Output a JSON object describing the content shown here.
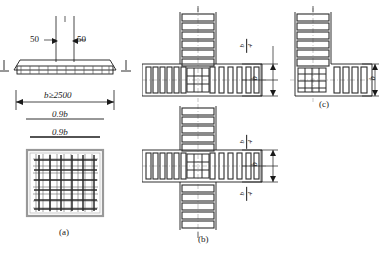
{
  "figure": {
    "title": "",
    "panels": [
      {
        "id": "a",
        "label": "(a)",
        "caption": "foundation slab reinforcement"
      },
      {
        "id": "b",
        "label": "(b)",
        "caption": "interior cruciform joint stirrups"
      },
      {
        "id": "c",
        "label": "(c)",
        "caption": "corner joint stirrups"
      }
    ]
  },
  "panel_a": {
    "label": "(a)",
    "cover_left": "50",
    "cover_right": "50",
    "level_mark_left": "⊥",
    "level_mark_right": "⊥",
    "dim_width": "b≥2500",
    "dim_mid": "0.9b",
    "dim_bottom": "0.9b",
    "grid_bars_h": 6,
    "grid_bars_v": 6,
    "mesh_lines_h": 9,
    "mesh_lines_v": 9
  },
  "panel_b": {
    "label": "(b)",
    "joints": 2,
    "dims_top": [
      {
        "num": "b",
        "den": "4"
      }
    ],
    "dims_mid": [
      {
        "num": "b",
        "den": ""
      }
    ],
    "dims_bottom": [
      {
        "num": "b",
        "den": "4"
      }
    ],
    "column_stirrups": 6,
    "beam_stirrups_left": 6,
    "beam_stirrups_right": 5
  },
  "panel_c": {
    "label": "(c)",
    "dims_right": [
      {
        "num": "b",
        "den": ""
      }
    ],
    "column_stirrups": 6,
    "beam_stirrups": 4
  },
  "colors": {
    "line": "#1a1a1a",
    "rebar": "#333333",
    "thin": "#555555",
    "hatch": "#777777",
    "background": "#ffffff"
  }
}
